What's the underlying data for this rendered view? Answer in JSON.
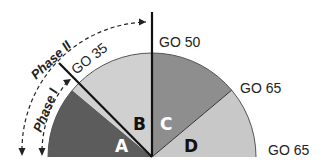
{
  "diagram": {
    "type": "semicircle-sectors",
    "sectors": [
      {
        "id": "A",
        "label": "A",
        "color": "#5c5c5c",
        "text_color": "#ffffff"
      },
      {
        "id": "B",
        "label": "B",
        "color": "#d0d0d0",
        "text_color": "#111111"
      },
      {
        "id": "C",
        "label": "C",
        "color": "#8e8e8e",
        "text_color": "#ffffff"
      },
      {
        "id": "D",
        "label": "D",
        "color": "#c8c8c8",
        "text_color": "#111111"
      }
    ],
    "boundary_labels": {
      "a_b": "GO 35",
      "b_c": "GO 50",
      "c_d": "GO 65",
      "d_end": "GO 65"
    },
    "phases": [
      {
        "id": "phase-1",
        "label": "Phase I"
      },
      {
        "id": "phase-2",
        "label": "Phase II"
      }
    ]
  }
}
